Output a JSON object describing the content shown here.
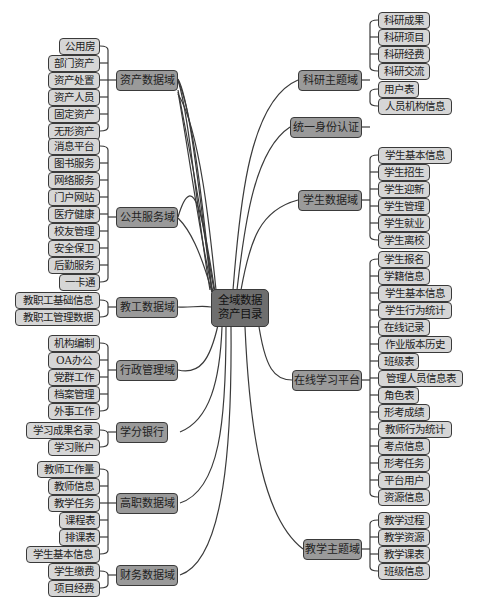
{
  "root": {
    "line1": "全域数据",
    "line2": "资产目录"
  },
  "left_branches": [
    {
      "label": "资产数据域",
      "items": [
        "公用房",
        "部门资产",
        "资产处置",
        "资产人员",
        "固定资产",
        "无形资产"
      ]
    },
    {
      "label": "公共服务域",
      "items": [
        "消息平台",
        "图书服务",
        "网络服务",
        "门户网站",
        "医疗健康",
        "校友管理",
        "安全保卫",
        "后勤服务",
        "一卡通"
      ]
    },
    {
      "label": "教工数据域",
      "items": [
        "教职工基础信息",
        "教职工管理数据"
      ]
    },
    {
      "label": "行政管理域",
      "items": [
        "机构编制",
        "OA办公",
        "党群工作",
        "档案管理",
        "外事工作"
      ]
    },
    {
      "label": "学分银行",
      "items": [
        "学习成果名录",
        "学习账户"
      ]
    },
    {
      "label": "高职数据域",
      "items": [
        "教师工作量",
        "教师信息",
        "教学任务",
        "课程表",
        "排课表",
        "学生基本信息"
      ]
    },
    {
      "label": "财务数据域",
      "items": [
        "学生缴费",
        "项目经费"
      ]
    }
  ],
  "right_branches": [
    {
      "label": "科研主题域",
      "items": [
        "科研成果",
        "科研项目",
        "科研经费",
        "科研交流"
      ]
    },
    {
      "label": "统一身份认证",
      "items": [
        "用户表",
        "人员机构信息"
      ]
    },
    {
      "label": "学生数据域",
      "items": [
        "学生基本信息",
        "学生招生",
        "学生迎新",
        "学生管理",
        "学生就业",
        "学生离校"
      ]
    },
    {
      "label": "在线学习平台",
      "items": [
        "学生报名",
        "学籍信息",
        "学生基本信息",
        "学生行为统计",
        "在线记录",
        "作业版本历史",
        "班级表",
        "管理人员信息表",
        "角色表",
        "形考成绩",
        "教师行为统计",
        "考点信息",
        "形考任务",
        "平台用户",
        "资源信息"
      ]
    },
    {
      "label": "教学主题域",
      "items": [
        "教学过程",
        "教学资源",
        "教学课表",
        "班级信息"
      ]
    }
  ],
  "colors": {
    "root": "#6e6e6e",
    "branch": "#9a9a9a",
    "leaf": "#d6d6d6",
    "line": "#3a3a3a"
  }
}
